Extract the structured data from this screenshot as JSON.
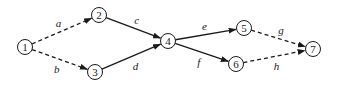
{
  "diagram": {
    "type": "activity-network",
    "nodes": [
      {
        "id": "1",
        "label": "1",
        "x": 25,
        "y": 47
      },
      {
        "id": "2",
        "label": "2",
        "x": 99,
        "y": 15
      },
      {
        "id": "3",
        "label": "3",
        "x": 95,
        "y": 72
      },
      {
        "id": "4",
        "label": "4",
        "x": 168,
        "y": 41
      },
      {
        "id": "5",
        "label": "5",
        "x": 244,
        "y": 28
      },
      {
        "id": "6",
        "label": "6",
        "x": 236,
        "y": 64
      },
      {
        "id": "7",
        "label": "7",
        "x": 313,
        "y": 49
      }
    ],
    "edges": [
      {
        "from": "1",
        "to": "2",
        "label": "a",
        "style": "dashed"
      },
      {
        "from": "1",
        "to": "3",
        "label": "b",
        "style": "dashed"
      },
      {
        "from": "2",
        "to": "4",
        "label": "c",
        "style": "solid"
      },
      {
        "from": "3",
        "to": "4",
        "label": "d",
        "style": "solid"
      },
      {
        "from": "4",
        "to": "5",
        "label": "e",
        "style": "solid"
      },
      {
        "from": "4",
        "to": "6",
        "label": "f",
        "style": "solid"
      },
      {
        "from": "5",
        "to": "7",
        "label": "g",
        "style": "dashed"
      },
      {
        "from": "6",
        "to": "7",
        "label": "h",
        "style": "dashed"
      }
    ]
  }
}
